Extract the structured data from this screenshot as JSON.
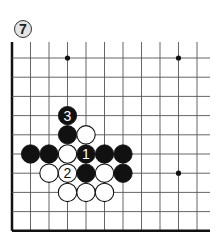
{
  "diagram": {
    "number_badge": "7",
    "board": {
      "columns": 11,
      "rows": 10,
      "origin_x": 12,
      "origin_y": 58,
      "spacing_x": 18.5,
      "spacing_y": 19.2,
      "edges": [
        "left",
        "bottom"
      ],
      "line_color": "#555555",
      "edge_color": "#111111"
    },
    "star_points": [
      [
        3,
        0
      ],
      [
        9,
        0
      ],
      [
        9,
        6
      ]
    ],
    "stones": [
      {
        "col": 3,
        "row": 3,
        "color": "black",
        "label": "3"
      },
      {
        "col": 3,
        "row": 4,
        "color": "black",
        "label": ""
      },
      {
        "col": 4,
        "row": 4,
        "color": "white",
        "label": ""
      },
      {
        "col": 1,
        "row": 5,
        "color": "black",
        "label": ""
      },
      {
        "col": 2,
        "row": 5,
        "color": "black",
        "label": ""
      },
      {
        "col": 3,
        "row": 5,
        "color": "white",
        "label": ""
      },
      {
        "col": 4,
        "row": 5,
        "color": "black",
        "label": "1"
      },
      {
        "col": 5,
        "row": 5,
        "color": "black",
        "label": ""
      },
      {
        "col": 6,
        "row": 5,
        "color": "black",
        "label": ""
      },
      {
        "col": 2,
        "row": 6,
        "color": "white",
        "label": ""
      },
      {
        "col": 3,
        "row": 6,
        "color": "white",
        "label": "2"
      },
      {
        "col": 4,
        "row": 6,
        "color": "black",
        "label": ""
      },
      {
        "col": 5,
        "row": 6,
        "color": "white",
        "label": ""
      },
      {
        "col": 6,
        "row": 6,
        "color": "black",
        "label": ""
      },
      {
        "col": 3,
        "row": 7,
        "color": "white",
        "label": ""
      },
      {
        "col": 4,
        "row": 7,
        "color": "white",
        "label": ""
      },
      {
        "col": 5,
        "row": 7,
        "color": "white",
        "label": ""
      }
    ]
  }
}
